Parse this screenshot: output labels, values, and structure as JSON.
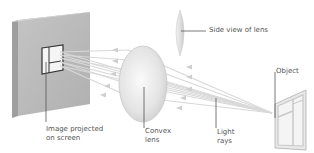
{
  "diagram": {
    "labels": {
      "side_view": "Side view of lens",
      "object": "Object",
      "image_line1": "Image projected",
      "image_line2": "on screen",
      "convex_line1": "Convex",
      "convex_line2": "lens",
      "light_line1": "Light",
      "light_line2": "rays"
    },
    "colors": {
      "screen_face": "#b9b9b9",
      "screen_edge": "#9a9a9a",
      "ray": "#d8d8d8",
      "lens": "#e6e6e6",
      "leader_line": "#555555",
      "text": "#555555"
    }
  }
}
